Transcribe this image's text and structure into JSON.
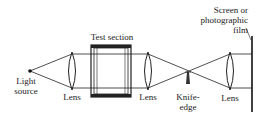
{
  "diagram": {
    "labels": {
      "light_source": [
        "Light",
        "source"
      ],
      "lens1": "Lens",
      "test_section": "Test section",
      "lens2": "Lens",
      "knife_edge": [
        "Knife-",
        "edge"
      ],
      "lens3": "Lens",
      "screen": [
        "Screen or",
        "photographic",
        "film"
      ]
    },
    "colors": {
      "line": "#222222",
      "background": "#ffffff"
    }
  }
}
